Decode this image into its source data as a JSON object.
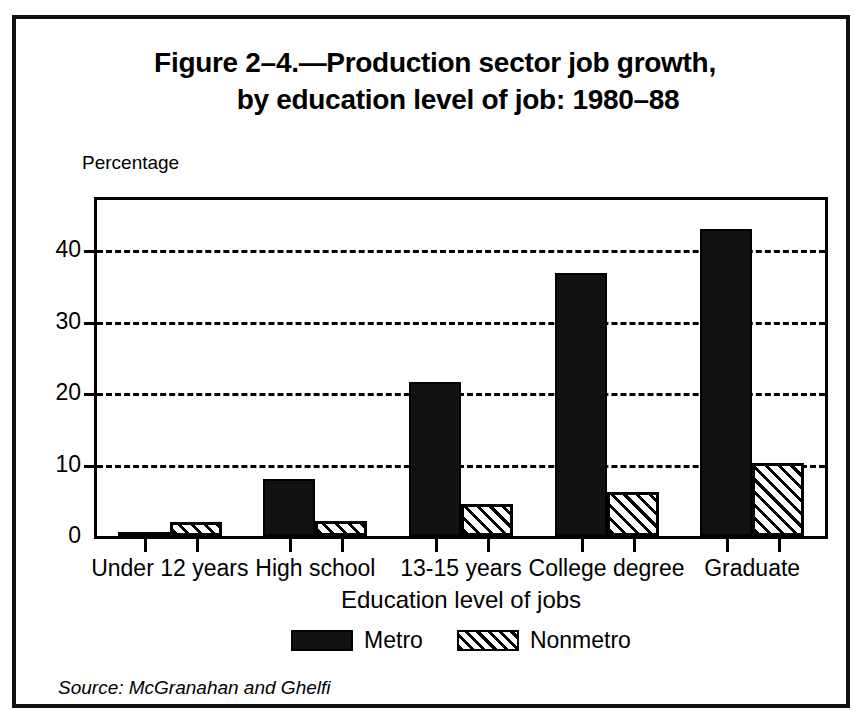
{
  "figure": {
    "title_line1": "Figure 2–4.—Production sector job growth,",
    "title_line2": "by education level of job: 1980–88",
    "source": "Source: McGranahan and Ghelfi"
  },
  "chart_data": {
    "type": "bar",
    "title": "Figure 2–4.—Production sector job growth, by education level of job: 1980–88",
    "subtitle": "",
    "xlabel": "Education level of jobs",
    "ylabel": "Percentage",
    "categories": [
      "Under 12 years",
      "High school",
      "13-15 years",
      "College degree",
      "Graduate"
    ],
    "series": [
      {
        "name": "Metro",
        "color": "#111111",
        "pattern": "solid",
        "values": [
          0.5,
          8.0,
          21.5,
          36.8,
          43.0
        ]
      },
      {
        "name": "Nonmetro",
        "color": "#000000",
        "pattern": "diagonal-hatch",
        "values": [
          2.0,
          2.1,
          4.5,
          6.1,
          10.2
        ]
      }
    ],
    "ylim": [
      0,
      47
    ],
    "yticks": [
      0,
      10,
      20,
      30,
      40
    ],
    "ytick_labels": [
      "0",
      "10",
      "20",
      "30",
      "40"
    ],
    "grid": "horizontal-dashed",
    "legend_position": "bottom-center"
  },
  "axis": {
    "y_caption": "Percentage",
    "x_title": "Education level of jobs"
  },
  "legend": {
    "items": [
      {
        "label": "Metro"
      },
      {
        "label": "Nonmetro"
      }
    ]
  }
}
